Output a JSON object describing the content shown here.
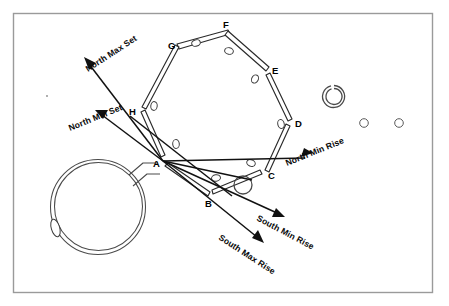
{
  "figure": {
    "kind": "archaeoastronomical site plan",
    "title_visible": false,
    "frame": {
      "x": 13,
      "y": 13,
      "width": 420,
      "height": 280,
      "border_color": "#9a9a9a"
    },
    "background_color": "#ffffff",
    "ink_color": "#111111"
  },
  "sight_lines": [
    {
      "id": "north-max-set",
      "label": "North Max Set",
      "direction": "northwest",
      "from": "A",
      "arrow_end": {
        "x": 84,
        "y": 60
      },
      "label_angle_deg": -33
    },
    {
      "id": "north-min-set",
      "label": "North Min Set",
      "direction": "west-northwest",
      "from": "A",
      "arrow_end": {
        "x": 96,
        "y": 111
      },
      "label_angle_deg": -22
    },
    {
      "id": "north-min-rise",
      "label": "North Min Rise",
      "direction": "east-northeast",
      "from": "A",
      "arrow_end": {
        "x": 312,
        "y": 154
      },
      "label_angle_deg": -22
    },
    {
      "id": "south-min-rise",
      "label": "South Min Rise",
      "direction": "east-southeast",
      "from": "A",
      "arrow_end": {
        "x": 282,
        "y": 216
      },
      "label_angle_deg": 28
    },
    {
      "id": "south-max-rise",
      "label": "South Max Rise",
      "direction": "southeast",
      "from": "A",
      "arrow_end": {
        "x": 262,
        "y": 241
      },
      "label_angle_deg": 33
    }
  ],
  "stone_nodes": [
    {
      "id": "A",
      "label": "A",
      "x": 162,
      "y": 160,
      "label_x": 155,
      "label_y": 166
    },
    {
      "id": "B",
      "label": "B",
      "x": 210,
      "y": 195,
      "label_x": 207,
      "label_y": 206
    },
    {
      "id": "C",
      "label": "C",
      "x": 266,
      "y": 173,
      "label_x": 268,
      "label_y": 178
    },
    {
      "id": "D",
      "label": "D",
      "x": 289,
      "y": 121,
      "label_x": 295,
      "label_y": 126
    },
    {
      "id": "E",
      "label": "E",
      "x": 268,
      "y": 69,
      "label_x": 272,
      "label_y": 73
    },
    {
      "id": "F",
      "label": "F",
      "x": 227,
      "y": 32,
      "label_x": 224,
      "label_y": 29
    },
    {
      "id": "G",
      "label": "G",
      "x": 177,
      "y": 46,
      "label_x": 171,
      "label_y": 48
    },
    {
      "id": "H",
      "label": "H",
      "x": 140,
      "y": 110,
      "label_x": 131,
      "label_y": 114
    }
  ],
  "other_features": [
    {
      "id": "henge-circle",
      "type": "circular-enclosure",
      "cx": 98,
      "cy": 207,
      "r": 47
    },
    {
      "id": "henge-entrance",
      "type": "avenue",
      "note": "entrance passage to point A"
    },
    {
      "id": "henge-left-stone",
      "type": "stone",
      "cx": 55,
      "cy": 228
    },
    {
      "id": "small-ring",
      "type": "ring-ditch",
      "cx": 334,
      "cy": 96,
      "r": 11
    },
    {
      "id": "pit-1",
      "type": "pit",
      "cx": 364,
      "cy": 123,
      "r": 4
    },
    {
      "id": "pit-2",
      "type": "pit",
      "cx": 399,
      "cy": 123,
      "r": 4
    },
    {
      "id": "central-ring",
      "type": "ring",
      "cx": 243,
      "cy": 185,
      "r": 9
    }
  ],
  "interior_stone_holes": [
    {
      "cx": 196,
      "cy": 41
    },
    {
      "cx": 227,
      "cy": 50
    },
    {
      "cx": 255,
      "cy": 79
    },
    {
      "cx": 280,
      "cy": 122
    },
    {
      "cx": 250,
      "cy": 163
    },
    {
      "cx": 218,
      "cy": 177
    },
    {
      "cx": 154,
      "cy": 105
    },
    {
      "cx": 175,
      "cy": 143
    }
  ]
}
